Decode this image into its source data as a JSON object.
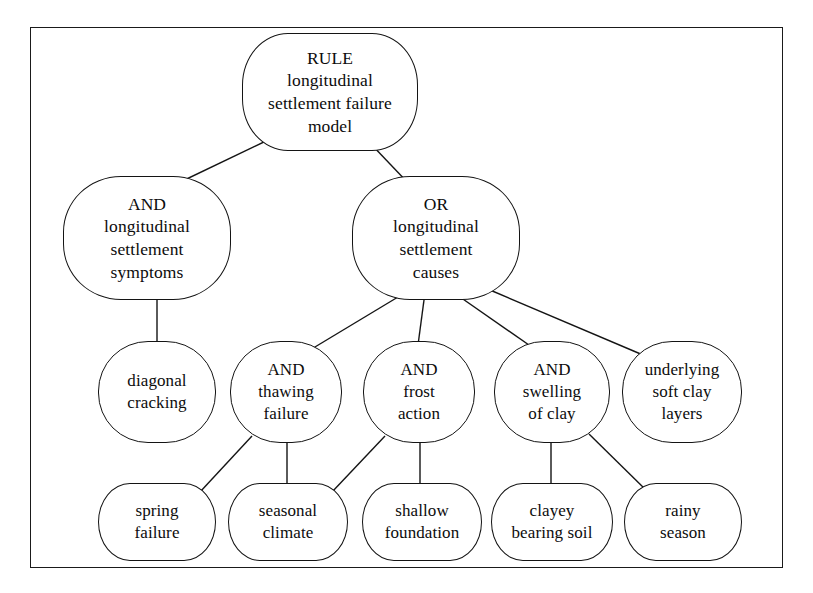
{
  "figure": {
    "type": "and-or-tree",
    "title_text": "",
    "border_color": "#1a1a1a",
    "node_border_color": "#141414",
    "node_fill": "#ffffff",
    "text_color": "#0c0c0c"
  },
  "nodes": [
    {
      "id": "root",
      "data_name": "node-rule-longitudinal-settlement-failure-model",
      "lines": [
        "RULE",
        "longitudinal",
        "settlement failure",
        "model"
      ],
      "x": 242,
      "y": 33,
      "w": 176,
      "h": 118,
      "shape": "n-root"
    },
    {
      "id": "and_symptoms",
      "data_name": "node-and-longitudinal-settlement-symptoms",
      "lines": [
        "AND",
        "longitudinal",
        "settlement",
        "symptoms"
      ],
      "x": 63,
      "y": 176,
      "w": 168,
      "h": 124,
      "shape": "n-lev2"
    },
    {
      "id": "or_causes",
      "data_name": "node-or-longitudinal-settlement-causes",
      "lines": [
        "OR",
        "longitudinal",
        "settlement",
        "causes"
      ],
      "x": 352,
      "y": 176,
      "w": 168,
      "h": 124,
      "shape": "n-lev2"
    },
    {
      "id": "diagonal_cracking",
      "data_name": "node-diagonal-cracking",
      "lines": [
        "diagonal",
        "cracking"
      ],
      "x": 98,
      "y": 341,
      "w": 118,
      "h": 102,
      "shape": "n-lev3"
    },
    {
      "id": "and_thawing",
      "data_name": "node-and-thawing-failure",
      "lines": [
        "AND",
        "thawing",
        "failure"
      ],
      "x": 230,
      "y": 341,
      "w": 112,
      "h": 102,
      "shape": "n-lev3"
    },
    {
      "id": "and_frost",
      "data_name": "node-and-frost-action",
      "lines": [
        "AND",
        "frost",
        "action"
      ],
      "x": 363,
      "y": 341,
      "w": 112,
      "h": 102,
      "shape": "n-lev3"
    },
    {
      "id": "and_swelling",
      "data_name": "node-and-swelling-of-clay",
      "lines": [
        "AND",
        "swelling",
        "of clay"
      ],
      "x": 494,
      "y": 341,
      "w": 116,
      "h": 102,
      "shape": "n-lev3"
    },
    {
      "id": "underlying_clay",
      "data_name": "node-underlying-soft-clay-layers",
      "lines": [
        "underlying",
        "soft clay",
        "layers"
      ],
      "x": 622,
      "y": 341,
      "w": 120,
      "h": 102,
      "shape": "n-lev3"
    },
    {
      "id": "spring_failure",
      "data_name": "node-spring-failure",
      "lines": [
        "spring",
        "failure"
      ],
      "x": 98,
      "y": 483,
      "w": 118,
      "h": 78,
      "shape": "n-leaf"
    },
    {
      "id": "seasonal_climate",
      "data_name": "node-seasonal-climate",
      "lines": [
        "seasonal",
        "climate"
      ],
      "x": 228,
      "y": 483,
      "w": 120,
      "h": 78,
      "shape": "n-leaf"
    },
    {
      "id": "shallow_foundation",
      "data_name": "node-shallow-foundation",
      "lines": [
        "shallow",
        "foundation"
      ],
      "x": 362,
      "y": 483,
      "w": 120,
      "h": 78,
      "shape": "n-leaf"
    },
    {
      "id": "clayey_bearing_soil",
      "data_name": "node-clayey-bearing-soil",
      "lines": [
        "clayey",
        "bearing soil"
      ],
      "x": 491,
      "y": 483,
      "w": 122,
      "h": 78,
      "shape": "n-leaf"
    },
    {
      "id": "rainy_season",
      "data_name": "node-rainy-season",
      "lines": [
        "rainy",
        "season"
      ],
      "x": 624,
      "y": 483,
      "w": 118,
      "h": 78,
      "shape": "n-leaf"
    }
  ],
  "edges": [
    {
      "data_name": "edge-root-to-and-symptoms",
      "from": "root",
      "to": "and_symptoms",
      "x1": 268,
      "y1": 140,
      "x2": 172,
      "y2": 186
    },
    {
      "data_name": "edge-root-to-or-causes",
      "from": "root",
      "to": "or_causes",
      "x1": 370,
      "y1": 143,
      "x2": 410,
      "y2": 185
    },
    {
      "data_name": "edge-and-symptoms-to-diagonal",
      "from": "and_symptoms",
      "to": "diagonal_cracking",
      "x1": 157,
      "y1": 298,
      "x2": 157,
      "y2": 346
    },
    {
      "data_name": "edge-or-causes-to-and-thawing",
      "from": "or_causes",
      "to": "and_thawing",
      "x1": 398,
      "y1": 297,
      "x2": 300,
      "y2": 356
    },
    {
      "data_name": "edge-or-causes-to-and-frost",
      "from": "or_causes",
      "to": "and_frost",
      "x1": 424,
      "y1": 300,
      "x2": 418,
      "y2": 345
    },
    {
      "data_name": "edge-or-causes-to-and-swelling",
      "from": "or_causes",
      "to": "and_swelling",
      "x1": 460,
      "y1": 297,
      "x2": 539,
      "y2": 352
    },
    {
      "data_name": "edge-or-causes-to-underlying",
      "from": "or_causes",
      "to": "underlying_clay",
      "x1": 490,
      "y1": 290,
      "x2": 643,
      "y2": 355
    },
    {
      "data_name": "edge-thawing-to-spring-failure",
      "from": "and_thawing",
      "to": "spring_failure",
      "x1": 252,
      "y1": 436,
      "x2": 200,
      "y2": 492
    },
    {
      "data_name": "edge-thawing-to-seasonal-climate",
      "from": "and_thawing",
      "to": "seasonal_climate",
      "x1": 287,
      "y1": 441,
      "x2": 287,
      "y2": 487
    },
    {
      "data_name": "edge-frost-to-seasonal-climate",
      "from": "and_frost",
      "to": "seasonal_climate",
      "x1": 385,
      "y1": 436,
      "x2": 332,
      "y2": 492
    },
    {
      "data_name": "edge-frost-to-shallow-foundation",
      "from": "and_frost",
      "to": "shallow_foundation",
      "x1": 420,
      "y1": 441,
      "x2": 420,
      "y2": 487
    },
    {
      "data_name": "edge-swelling-to-clayey-soil",
      "from": "and_swelling",
      "to": "clayey_bearing_soil",
      "x1": 551,
      "y1": 441,
      "x2": 551,
      "y2": 487
    },
    {
      "data_name": "edge-swelling-to-rainy-season",
      "from": "and_swelling",
      "to": "rainy_season",
      "x1": 589,
      "y1": 434,
      "x2": 648,
      "y2": 492
    }
  ]
}
